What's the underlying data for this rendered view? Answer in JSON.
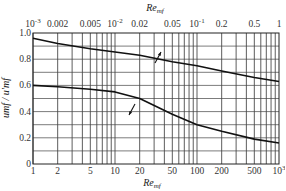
{
  "chart_data": {
    "type": "line",
    "title": "",
    "xlabel_top": "Re'mf",
    "xlabel_bottom": "Re'mf",
    "ylabel": "umf / u'mf",
    "ylim": [
      0,
      1.0
    ],
    "grid": true,
    "x_top_scale": "log",
    "x_top_range": [
      0.001,
      1
    ],
    "x_top_ticks": [
      "10^-3",
      "0.002",
      "0.005",
      "10^-2",
      "0.02",
      "0.05",
      "10^-1",
      "0.2",
      "0.5",
      "1"
    ],
    "x_bottom_scale": "log",
    "x_bottom_range": [
      1,
      1000
    ],
    "x_bottom_ticks": [
      "1",
      "2",
      "5",
      "10",
      "20",
      "50",
      "100",
      "200",
      "500",
      "10^3"
    ],
    "y_ticks": [
      "0",
      "0.2",
      "0.4",
      "0.6",
      "0.8",
      "1.0"
    ],
    "series": [
      {
        "name": "upper curve (read against top axis)",
        "axis": "top",
        "x": [
          0.001,
          0.002,
          0.005,
          0.01,
          0.02,
          0.05,
          0.1,
          0.2,
          0.5,
          1
        ],
        "values": [
          0.96,
          0.92,
          0.88,
          0.855,
          0.83,
          0.78,
          0.75,
          0.71,
          0.66,
          0.63
        ]
      },
      {
        "name": "lower curve (read against bottom axis)",
        "axis": "bottom",
        "x": [
          1,
          2,
          5,
          10,
          20,
          50,
          100,
          200,
          500,
          1000
        ],
        "values": [
          0.6,
          0.59,
          0.57,
          0.55,
          0.5,
          0.38,
          0.3,
          0.25,
          0.19,
          0.16
        ]
      }
    ],
    "annotations": [
      {
        "type": "arrow",
        "points_to": "top axis",
        "near": "upper curve at x≈0.025"
      },
      {
        "type": "arrow",
        "points_to": "bottom axis",
        "near": "lower curve at x≈15"
      }
    ]
  },
  "labels": {
    "top_axis_title": "Re",
    "top_axis_sub": "mf",
    "bottom_axis_title": "Re",
    "bottom_axis_sub": "mf",
    "y_axis_title": "umf / u'mf"
  }
}
